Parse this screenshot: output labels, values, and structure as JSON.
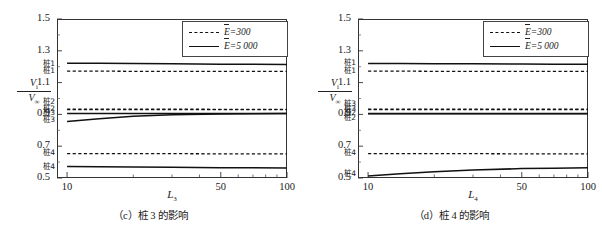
{
  "figure": {
    "background": "#ffffff",
    "line_color": "#111111",
    "axis_color": "#333333"
  },
  "panels": [
    {
      "id": "panel-c",
      "caption": "（c）桩 3 的影响",
      "y_axis_title_numerator": "V",
      "y_axis_title_numerator_sub": "i",
      "y_axis_title_denominator": "V",
      "y_axis_title_denominator_sub": "∞",
      "x_axis_title": "L",
      "x_axis_title_sub": "3",
      "legend": {
        "dashed_label": "E=300",
        "solid_label": "E=5 000"
      },
      "curve_labels": [
        {
          "text": "桩1",
          "value": 1.215
        },
        {
          "text": "桩1",
          "value": 1.17
        },
        {
          "text": "桩2",
          "value": 0.975
        },
        {
          "text": "桩2",
          "value": 0.932
        },
        {
          "text": "桩3",
          "value": 0.905
        },
        {
          "text": "桩3",
          "value": 0.86
        },
        {
          "text": "桩4",
          "value": 0.653
        },
        {
          "text": "桩4",
          "value": 0.565
        }
      ],
      "chart_data": {
        "type": "line",
        "title": "（c）桩 3 的影响",
        "xlabel": "L̄₃",
        "ylabel": "Vi/V∞",
        "xscale": "log",
        "xlim": [
          9,
          100
        ],
        "ylim": [
          0.5,
          1.5
        ],
        "xticks": [
          10,
          50,
          100
        ],
        "yticks": [
          0.5,
          0.7,
          0.9,
          1.1,
          1.3,
          1.5
        ],
        "grid": false,
        "legend_position": "top-right",
        "x": [
          10,
          14,
          20,
          30,
          50,
          70,
          100
        ],
        "series": [
          {
            "name": "桩1 E=5 000",
            "style": "solid",
            "values": [
              1.222,
              1.221,
              1.22,
              1.218,
              1.216,
              1.215,
              1.214
            ]
          },
          {
            "name": "桩1 E=300",
            "style": "dashed",
            "values": [
              1.172,
              1.172,
              1.171,
              1.171,
              1.17,
              1.17,
              1.17
            ]
          },
          {
            "name": "桩2 E=300",
            "style": "dashed",
            "values": [
              0.933,
              0.933,
              0.933,
              0.933,
              0.932,
              0.932,
              0.932
            ]
          },
          {
            "name": "桩2 E=5 000",
            "style": "solid",
            "values": [
              0.905,
              0.905,
              0.905,
              0.905,
              0.905,
              0.905,
              0.905
            ]
          },
          {
            "name": "桩3 E=300",
            "style": "dashed",
            "values": [
              0.93,
              0.93,
              0.93,
              0.93,
              0.93,
              0.93,
              0.93
            ]
          },
          {
            "name": "桩3 E=5 000",
            "style": "solid",
            "values": [
              0.856,
              0.872,
              0.888,
              0.898,
              0.903,
              0.904,
              0.905
            ]
          },
          {
            "name": "桩4 E=300",
            "style": "dashed",
            "values": [
              0.653,
              0.653,
              0.653,
              0.653,
              0.652,
              0.652,
              0.652
            ]
          },
          {
            "name": "桩4 E=5 000",
            "style": "solid",
            "values": [
              0.573,
              0.571,
              0.569,
              0.567,
              0.565,
              0.564,
              0.563
            ]
          }
        ]
      }
    },
    {
      "id": "panel-d",
      "caption": "（d）桩 4 的影响",
      "y_axis_title_numerator": "V",
      "y_axis_title_numerator_sub": "i",
      "y_axis_title_denominator": "V",
      "y_axis_title_denominator_sub": "∞",
      "x_axis_title": "L",
      "x_axis_title_sub": "4",
      "legend": {
        "dashed_label": "E=300",
        "solid_label": "E=5 000"
      },
      "curve_labels": [
        {
          "text": "桩1",
          "value": 1.218
        },
        {
          "text": "桩1",
          "value": 1.17
        },
        {
          "text": "桩3",
          "value": 0.962
        },
        {
          "text": "桩3",
          "value": 0.932
        },
        {
          "text": "桩2",
          "value": 0.905
        },
        {
          "text": "桩2",
          "value": 0.872
        },
        {
          "text": "桩4",
          "value": 0.653
        },
        {
          "text": "桩4",
          "value": 0.52
        }
      ],
      "chart_data": {
        "type": "line",
        "title": "（d）桩 4 的影响",
        "xlabel": "L̄₄",
        "ylabel": "Vi/V∞",
        "xscale": "log",
        "xlim": [
          9,
          100
        ],
        "ylim": [
          0.5,
          1.5
        ],
        "xticks": [
          10,
          50,
          100
        ],
        "yticks": [
          0.5,
          0.7,
          0.9,
          1.1,
          1.3,
          1.5
        ],
        "grid": false,
        "legend_position": "top-right",
        "x": [
          10,
          14,
          20,
          30,
          50,
          70,
          100
        ],
        "series": [
          {
            "name": "桩1 E=5 000",
            "style": "solid",
            "values": [
              1.22,
              1.22,
              1.219,
              1.218,
              1.217,
              1.216,
              1.216
            ]
          },
          {
            "name": "桩1 E=300",
            "style": "dashed",
            "values": [
              1.172,
              1.172,
              1.171,
              1.171,
              1.17,
              1.17,
              1.17
            ]
          },
          {
            "name": "桩3 E=300",
            "style": "dashed",
            "values": [
              0.933,
              0.933,
              0.933,
              0.933,
              0.933,
              0.933,
              0.933
            ]
          },
          {
            "name": "桩3 E=5 000",
            "style": "solid",
            "values": [
              0.906,
              0.906,
              0.906,
              0.906,
              0.906,
              0.906,
              0.906
            ]
          },
          {
            "name": "桩2 E=300",
            "style": "dashed",
            "values": [
              0.93,
              0.93,
              0.93,
              0.93,
              0.93,
              0.93,
              0.93
            ]
          },
          {
            "name": "桩2 E=5 000",
            "style": "solid",
            "values": [
              0.904,
              0.904,
              0.904,
              0.904,
              0.904,
              0.904,
              0.904
            ]
          },
          {
            "name": "桩4 E=300",
            "style": "dashed",
            "values": [
              0.653,
              0.653,
              0.653,
              0.653,
              0.652,
              0.652,
              0.652
            ]
          },
          {
            "name": "桩4 E=5 000",
            "style": "solid",
            "values": [
              0.513,
              0.527,
              0.54,
              0.551,
              0.559,
              0.562,
              0.565
            ]
          }
        ]
      }
    }
  ]
}
